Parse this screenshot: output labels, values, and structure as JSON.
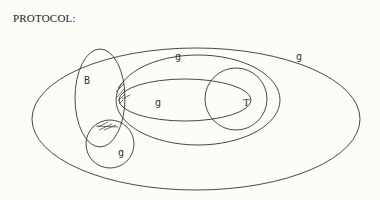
{
  "diagram": {
    "title": "PROTOCOL:",
    "regions": [
      {
        "id": "outer",
        "label": "g"
      },
      {
        "id": "middle",
        "label": "g"
      },
      {
        "id": "inner",
        "label": "g"
      },
      {
        "id": "B",
        "label": "B"
      },
      {
        "id": "T",
        "label": "T"
      },
      {
        "id": "small",
        "label": "g"
      }
    ],
    "colors": {
      "background": "#fdfdf8",
      "stroke": "#333333"
    }
  }
}
